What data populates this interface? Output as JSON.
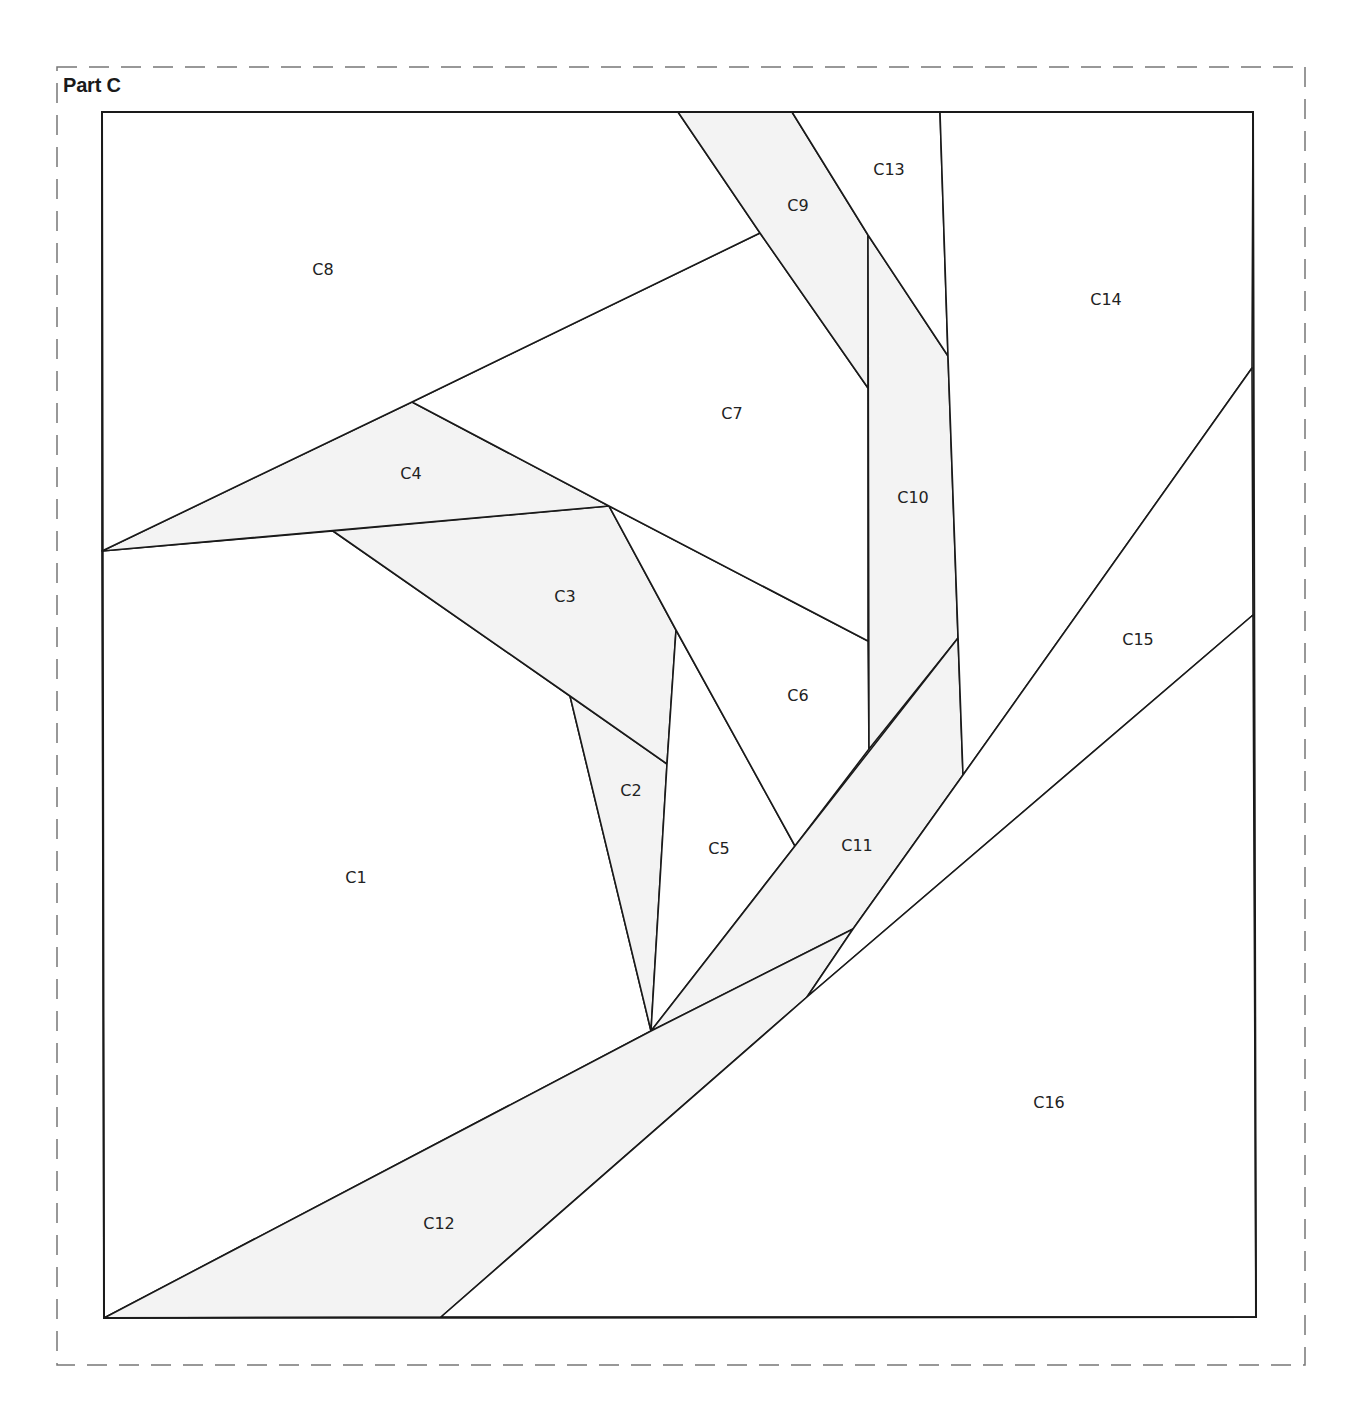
{
  "title": "Part C",
  "colors": {
    "line": "#1a1a1a",
    "dash": "#777777",
    "shaded": "#f3f3f3",
    "plain": "#ffffff"
  },
  "pieces": [
    {
      "id": "C1",
      "label": "C1",
      "shaded": false,
      "label_pos": [
        356,
        877
      ],
      "points": [
        [
          102,
          551
        ],
        [
          333,
          531
        ],
        [
          570,
          696
        ],
        [
          651,
          1031
        ],
        [
          104,
          1318
        ]
      ]
    },
    {
      "id": "C2",
      "label": "C2",
      "shaded": true,
      "label_pos": [
        631,
        790
      ],
      "points": [
        [
          570,
          696
        ],
        [
          667,
          764
        ],
        [
          651,
          1031
        ]
      ]
    },
    {
      "id": "C3",
      "label": "C3",
      "shaded": true,
      "label_pos": [
        565,
        596
      ],
      "points": [
        [
          333,
          531
        ],
        [
          609,
          506
        ],
        [
          676,
          630
        ],
        [
          667,
          764
        ],
        [
          570,
          696
        ]
      ]
    },
    {
      "id": "C4",
      "label": "C4",
      "shaded": true,
      "label_pos": [
        411,
        473
      ],
      "points": [
        [
          102,
          551
        ],
        [
          412,
          402
        ],
        [
          609,
          506
        ]
      ]
    },
    {
      "id": "C5",
      "label": "C5",
      "shaded": false,
      "label_pos": [
        719,
        848
      ],
      "points": [
        [
          676,
          630
        ],
        [
          795,
          846
        ],
        [
          651,
          1031
        ],
        [
          667,
          764
        ]
      ]
    },
    {
      "id": "C6",
      "label": "C6",
      "shaded": false,
      "label_pos": [
        798,
        695
      ],
      "points": [
        [
          609,
          506
        ],
        [
          868,
          641
        ],
        [
          869,
          749
        ],
        [
          795,
          846
        ],
        [
          676,
          630
        ]
      ]
    },
    {
      "id": "C7",
      "label": "C7",
      "shaded": false,
      "label_pos": [
        732,
        413
      ],
      "points": [
        [
          412,
          402
        ],
        [
          760,
          233
        ],
        [
          868,
          388
        ],
        [
          868,
          641
        ],
        [
          609,
          506
        ]
      ]
    },
    {
      "id": "C8",
      "label": "C8",
      "shaded": false,
      "label_pos": [
        323,
        269
      ],
      "points": [
        [
          102,
          112
        ],
        [
          678,
          112
        ],
        [
          760,
          233
        ],
        [
          412,
          402
        ],
        [
          102,
          551
        ]
      ]
    },
    {
      "id": "C9",
      "label": "C9",
      "shaded": true,
      "label_pos": [
        798,
        205
      ],
      "points": [
        [
          678,
          112
        ],
        [
          792,
          112
        ],
        [
          868,
          235
        ],
        [
          868,
          388
        ],
        [
          760,
          233
        ]
      ]
    },
    {
      "id": "C10",
      "label": "C10",
      "shaded": true,
      "label_pos": [
        913,
        497
      ],
      "points": [
        [
          868,
          235
        ],
        [
          948,
          356
        ],
        [
          958,
          638
        ],
        [
          869,
          749
        ]
      ]
    },
    {
      "id": "C11",
      "label": "C11",
      "shaded": true,
      "label_pos": [
        857,
        845
      ],
      "points": [
        [
          795,
          846
        ],
        [
          958,
          638
        ],
        [
          963,
          775
        ],
        [
          853,
          929
        ],
        [
          651,
          1031
        ]
      ]
    },
    {
      "id": "C12",
      "label": "C12",
      "shaded": true,
      "label_pos": [
        439,
        1223
      ],
      "points": [
        [
          104,
          1318
        ],
        [
          651,
          1031
        ],
        [
          853,
          929
        ],
        [
          807,
          997
        ],
        [
          441,
          1317
        ]
      ]
    },
    {
      "id": "C13",
      "label": "C13",
      "shaded": false,
      "label_pos": [
        889,
        169
      ],
      "points": [
        [
          792,
          112
        ],
        [
          940,
          112
        ],
        [
          948,
          356
        ],
        [
          868,
          235
        ]
      ]
    },
    {
      "id": "C14",
      "label": "C14",
      "shaded": false,
      "label_pos": [
        1106,
        299
      ],
      "points": [
        [
          940,
          112
        ],
        [
          1253,
          112
        ],
        [
          1252,
          368
        ],
        [
          963,
          775
        ],
        [
          948,
          356
        ]
      ]
    },
    {
      "id": "C15",
      "label": "C15",
      "shaded": false,
      "label_pos": [
        1138,
        639
      ],
      "points": [
        [
          1252,
          368
        ],
        [
          1253,
          615
        ],
        [
          807,
          997
        ],
        [
          853,
          929
        ],
        [
          963,
          775
        ]
      ]
    },
    {
      "id": "C16",
      "label": "C16",
      "shaded": false,
      "label_pos": [
        1049,
        1102
      ],
      "points": [
        [
          441,
          1317
        ],
        [
          807,
          997
        ],
        [
          1253,
          615
        ],
        [
          1256,
          1317
        ]
      ]
    }
  ],
  "outer_square": [
    [
      102,
      112
    ],
    [
      1253,
      112
    ],
    [
      1256,
      1317
    ],
    [
      104,
      1318
    ]
  ],
  "seam_allowance_box": {
    "x": 57,
    "y": 67,
    "w": 1248,
    "h": 1298
  }
}
